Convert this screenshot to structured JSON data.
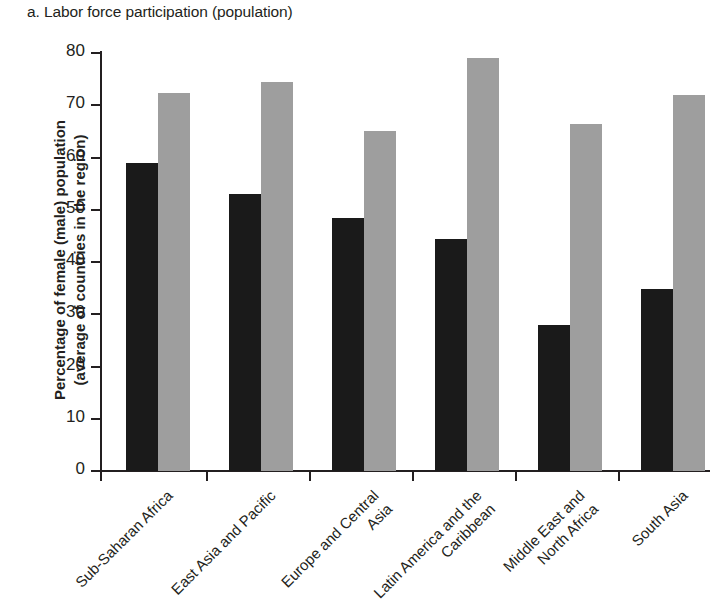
{
  "chart_data": {
    "type": "bar",
    "title": "a. Labor force participation (population)",
    "xlabel": "",
    "ylabel": "Percentage of female (male) population (average of countries in the region)",
    "ylabel_lines": [
      "Percentage of female (male) population",
      "(average of countries in the region)"
    ],
    "ylim": [
      0,
      80
    ],
    "yticks": [
      0,
      10,
      20,
      30,
      40,
      50,
      60,
      70,
      80
    ],
    "ytick_labels": [
      "0",
      "10",
      "20",
      "30",
      "40",
      "50",
      "60",
      "70",
      "80"
    ],
    "grid": false,
    "legend": false,
    "legend_position": "none",
    "categories": [
      "Sub-Saharan Africa",
      "East Asia and Pacific",
      "Europe and Central Asia",
      "Latin America and the Caribbean",
      "Middle East and North Africa",
      "South Asia"
    ],
    "category_label_lines": [
      [
        "Sub-Saharan Africa"
      ],
      [
        "East Asia and Pacific"
      ],
      [
        "Europe and Central",
        "Asia"
      ],
      [
        "Latin America and the",
        "Caribbean"
      ],
      [
        "Middle East and",
        "North Africa"
      ],
      [
        "South Asia"
      ]
    ],
    "series": [
      {
        "name": "female",
        "color": "#1a1a1a",
        "values": [
          59.0,
          53.0,
          48.4,
          44.5,
          27.9,
          34.8
        ]
      },
      {
        "name": "male",
        "color": "#9e9e9e",
        "values": [
          72.3,
          74.4,
          65.1,
          79.0,
          66.5,
          72.0
        ]
      }
    ]
  }
}
